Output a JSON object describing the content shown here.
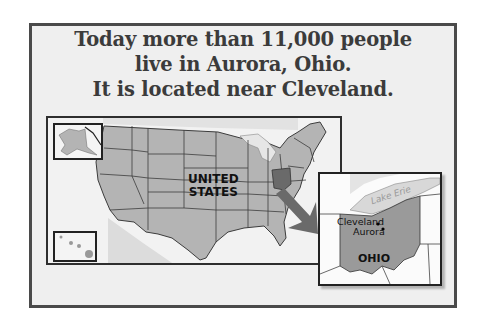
{
  "title": {
    "lines": [
      "Today more than 11,000 people",
      "live in Aurora, Ohio.",
      "It is located near Cleveland."
    ]
  },
  "us_map": {
    "label_line1": "UNITED",
    "label_line2": "STATES",
    "insets": [
      "alaska-inset",
      "hawaii-inset"
    ],
    "highlighted_state": "Ohio"
  },
  "ohio_inset": {
    "state_label": "OHIO",
    "water_label": "Lake Erie",
    "cities": [
      {
        "name": "Cleveland"
      },
      {
        "name": "Aurora"
      }
    ]
  },
  "colors": {
    "background": "#efefef",
    "frame_border": "#4a4a4a",
    "state_fill": "#b4b4b4",
    "highlight_fill": "#6a6a6a",
    "ohio_fill": "#9a9a9a",
    "water": "#d8d8d8",
    "text": "#3b3b3b"
  }
}
